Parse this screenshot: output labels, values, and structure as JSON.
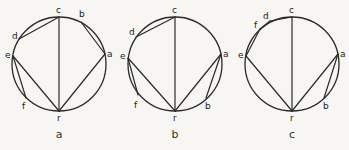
{
  "diagrams": [
    {
      "caption": "a",
      "caption_pos": [
        59,
        138
      ],
      "center": [
        59,
        64
      ],
      "radius": 47,
      "points": {
        "c": {
          "xy": [
            59,
            17
          ],
          "label_xy": [
            56,
            13
          ]
        },
        "b": {
          "xy": [
            81,
            22
          ],
          "label_xy": [
            79,
            17
          ]
        },
        "a": {
          "xy": [
            105,
            54
          ],
          "label_xy": [
            107,
            57
          ]
        },
        "d": {
          "xy": [
            19,
            39
          ],
          "label_xy": [
            12,
            39
          ]
        },
        "e": {
          "xy": [
            13,
            56
          ],
          "label_xy": [
            5,
            58
          ]
        },
        "f": {
          "xy": [
            26,
            98
          ],
          "label_xy": [
            22,
            109
          ]
        },
        "r": {
          "xy": [
            59,
            111
          ],
          "label_xy": [
            57,
            121
          ]
        }
      },
      "chords": [
        [
          "c",
          "r"
        ],
        [
          "c",
          "d"
        ],
        [
          "b",
          "a"
        ],
        [
          "a",
          "r"
        ],
        [
          "e",
          "r"
        ],
        [
          "e",
          "f"
        ]
      ]
    },
    {
      "caption": "b",
      "caption_pos": [
        175,
        138
      ],
      "center": [
        175,
        64
      ],
      "radius": 47,
      "points": {
        "c": {
          "xy": [
            175,
            17
          ],
          "label_xy": [
            172,
            13
          ]
        },
        "d": {
          "xy": [
            136,
            37
          ],
          "label_xy": [
            129,
            35
          ]
        },
        "e": {
          "xy": [
            128,
            58
          ],
          "label_xy": [
            120,
            59
          ]
        },
        "f": {
          "xy": [
            138,
            95
          ],
          "label_xy": [
            134,
            108
          ]
        },
        "r": {
          "xy": [
            175,
            111
          ],
          "label_xy": [
            173,
            121
          ]
        },
        "b": {
          "xy": [
            206,
            98
          ],
          "label_xy": [
            205,
            109
          ]
        },
        "a": {
          "xy": [
            221,
            54
          ],
          "label_xy": [
            223,
            57
          ]
        }
      },
      "chords": [
        [
          "c",
          "r"
        ],
        [
          "c",
          "d"
        ],
        [
          "e",
          "r"
        ],
        [
          "e",
          "f"
        ],
        [
          "a",
          "r"
        ],
        [
          "a",
          "b"
        ]
      ]
    },
    {
      "caption": "c",
      "caption_pos": [
        292,
        138
      ],
      "center": [
        292,
        64
      ],
      "radius": 47,
      "points": {
        "c": {
          "xy": [
            292,
            17
          ],
          "label_xy": [
            289,
            13
          ]
        },
        "d": {
          "xy": [
            270,
            21
          ],
          "label_xy": [
            263,
            19
          ]
        },
        "f": {
          "xy": [
            260,
            29
          ],
          "label_xy": [
            254,
            28
          ]
        },
        "e": {
          "xy": [
            246,
            56
          ],
          "label_xy": [
            238,
            58
          ]
        },
        "r": {
          "xy": [
            292,
            111
          ],
          "label_xy": [
            290,
            121
          ]
        },
        "b": {
          "xy": [
            324,
            98
          ],
          "label_xy": [
            323,
            109
          ]
        },
        "a": {
          "xy": [
            338,
            54
          ],
          "label_xy": [
            340,
            57
          ]
        }
      },
      "chords": [
        [
          "c",
          "r"
        ],
        [
          "c",
          "d"
        ],
        [
          "d",
          "f"
        ],
        [
          "f",
          "e"
        ],
        [
          "e",
          "r"
        ],
        [
          "a",
          "r"
        ],
        [
          "a",
          "b"
        ]
      ]
    }
  ],
  "colors": {
    "stroke": "#2a2a2a",
    "background": "#f7f6f2"
  }
}
